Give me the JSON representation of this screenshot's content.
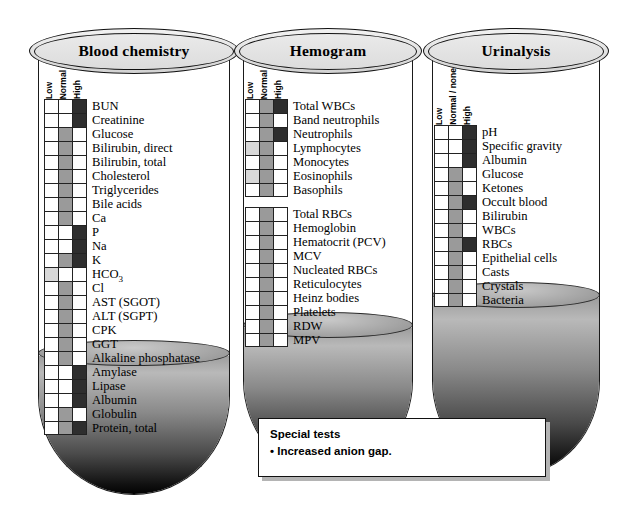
{
  "panels": [
    {
      "id": "blood-chemistry",
      "title": "Blood chemistry",
      "columns": [
        "Low",
        "Normal",
        "High"
      ],
      "groups": [
        {
          "rows": [
            {
              "label": "BUN",
              "marks": [
                "high"
              ]
            },
            {
              "label": "Creatinine",
              "marks": [
                "high"
              ]
            },
            {
              "label": "Glucose",
              "marks": [
                "normal"
              ]
            },
            {
              "label": "Bilirubin, direct",
              "marks": [
                "normal"
              ]
            },
            {
              "label": "Bilirubin, total",
              "marks": [
                "normal"
              ]
            },
            {
              "label": "Cholesterol",
              "marks": [
                "normal"
              ]
            },
            {
              "label": "Triglycerides",
              "marks": [
                "normal"
              ]
            },
            {
              "label": "Bile acids",
              "marks": [
                "normal"
              ]
            },
            {
              "label": "Ca",
              "marks": [
                "normal"
              ]
            },
            {
              "label": "P",
              "marks": [
                "high"
              ]
            },
            {
              "label": "Na",
              "marks": [
                "high"
              ]
            },
            {
              "label": "K",
              "marks": [
                "normal",
                "high"
              ]
            },
            {
              "label": "HCO3",
              "marks": [
                "low"
              ]
            },
            {
              "label": "Cl",
              "marks": [
                "normal"
              ]
            },
            {
              "label": "AST (SGOT)",
              "marks": [
                "normal"
              ]
            },
            {
              "label": "ALT (SGPT)",
              "marks": [
                "normal"
              ]
            },
            {
              "label": "CPK",
              "marks": [
                "normal"
              ]
            },
            {
              "label": "GGT",
              "marks": [
                "normal"
              ]
            },
            {
              "label": "Alkaline phosphatase",
              "marks": [
                "normal"
              ]
            },
            {
              "label": "Amylase",
              "marks": [
                "high"
              ]
            },
            {
              "label": "Lipase",
              "marks": [
                "high"
              ]
            },
            {
              "label": "Albumin",
              "marks": [
                "high"
              ]
            },
            {
              "label": "Globulin",
              "marks": [
                "normal"
              ]
            },
            {
              "label": "Protein, total",
              "marks": [
                "normal",
                "high"
              ]
            }
          ]
        }
      ]
    },
    {
      "id": "hemogram",
      "title": "Hemogram",
      "columns": [
        "Low",
        "Normal",
        "High"
      ],
      "groups": [
        {
          "rows": [
            {
              "label": "Total WBCs",
              "marks": [
                "normal",
                "high"
              ]
            },
            {
              "label": "Band neutrophils",
              "marks": [
                "normal"
              ]
            },
            {
              "label": "Neutrophils",
              "marks": [
                "normal",
                "high"
              ]
            },
            {
              "label": "Lymphocytes",
              "marks": [
                "low",
                "normal"
              ]
            },
            {
              "label": "Monocytes",
              "marks": [
                "normal"
              ]
            },
            {
              "label": "Eosinophils",
              "marks": [
                "low",
                "normal"
              ]
            },
            {
              "label": "Basophils",
              "marks": [
                "normal"
              ]
            }
          ]
        },
        {
          "rows": [
            {
              "label": "Total RBCs",
              "marks": [
                "normal"
              ]
            },
            {
              "label": "Hemoglobin",
              "marks": [
                "normal"
              ]
            },
            {
              "label": "Hematocrit (PCV)",
              "marks": [
                "normal"
              ]
            },
            {
              "label": "MCV",
              "marks": [
                "normal"
              ]
            },
            {
              "label": "Nucleated RBCs",
              "marks": [
                "normal"
              ]
            },
            {
              "label": "Reticulocytes",
              "marks": [
                "normal"
              ]
            },
            {
              "label": "Heinz bodies",
              "marks": [
                "normal"
              ]
            },
            {
              "label": "Platelets",
              "marks": [
                "normal"
              ]
            },
            {
              "label": "RDW",
              "marks": [
                "normal"
              ]
            },
            {
              "label": "MPV",
              "marks": [
                "normal"
              ]
            }
          ]
        }
      ]
    },
    {
      "id": "urinalysis",
      "title": "Urinalysis",
      "columns": [
        "Low",
        "Normal / none",
        "High"
      ],
      "groups": [
        {
          "rows": [
            {
              "label": "pH",
              "marks": [
                "high"
              ]
            },
            {
              "label": "Specific gravity",
              "marks": [
                "high"
              ]
            },
            {
              "label": "Albumin",
              "marks": [
                "high"
              ]
            },
            {
              "label": "Glucose",
              "marks": [
                "normal"
              ]
            },
            {
              "label": "Ketones",
              "marks": [
                "normal"
              ]
            },
            {
              "label": "Occult blood",
              "marks": [
                "normal",
                "high"
              ]
            },
            {
              "label": "Bilirubin",
              "marks": [
                "normal"
              ]
            },
            {
              "label": "WBCs",
              "marks": [
                "normal"
              ]
            },
            {
              "label": "RBCs",
              "marks": [
                "normal",
                "high"
              ]
            },
            {
              "label": "Epithelial cells",
              "marks": [
                "normal"
              ]
            },
            {
              "label": "Casts",
              "marks": [
                "normal"
              ]
            },
            {
              "label": "Crystals",
              "marks": [
                "normal"
              ]
            },
            {
              "label": "Bacteria",
              "marks": [
                "normal"
              ]
            }
          ]
        }
      ]
    }
  ],
  "special_tests": {
    "title": "Special tests",
    "items": [
      "• Increased anion gap."
    ]
  },
  "legend_colors": {
    "low": "#d8d8d8",
    "normal": "#9a9a9a",
    "high": "#2e2e2e",
    "empty": "#ffffff",
    "outline": "#222222"
  }
}
